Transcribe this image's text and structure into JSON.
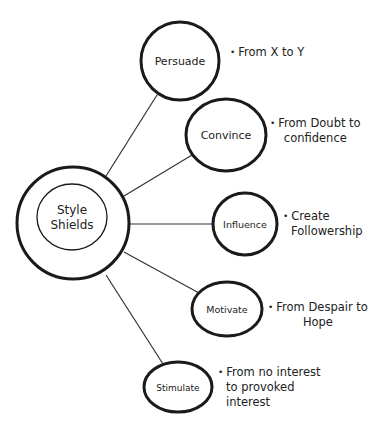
{
  "diagram": {
    "center": {
      "line1": "Style",
      "line2": "Shields"
    },
    "nodes": [
      {
        "label": "Persuade",
        "note_lines": [
          "From X to Y"
        ]
      },
      {
        "label": "Convince",
        "note_lines": [
          "From Doubt to",
          "confidence"
        ]
      },
      {
        "label": "Influence",
        "note_lines": [
          "Create",
          "Followership"
        ]
      },
      {
        "label": "Motivate",
        "note_lines": [
          "From Despair to",
          "Hope"
        ]
      },
      {
        "label": "Stimulate",
        "note_lines": [
          "From no interest",
          "to provoked",
          "interest"
        ]
      }
    ],
    "bullet": "•"
  }
}
